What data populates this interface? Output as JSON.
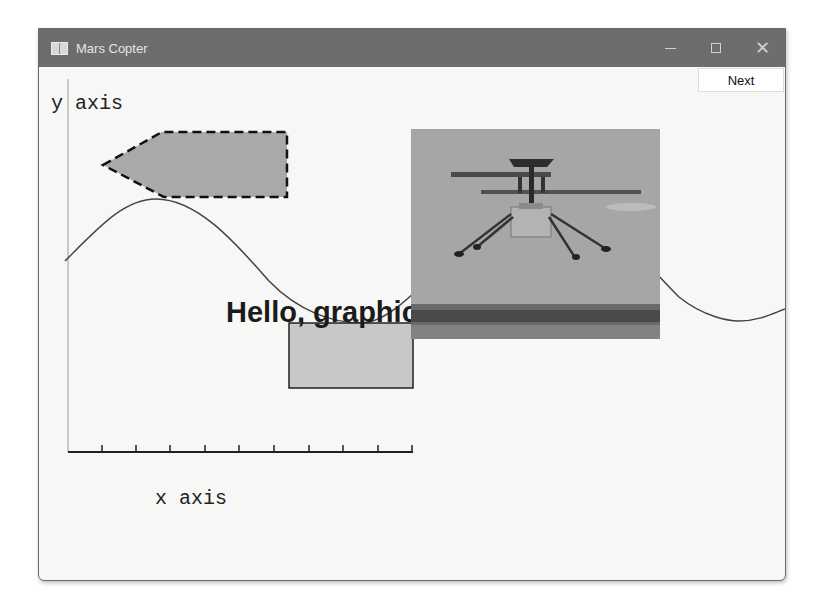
{
  "window": {
    "title": "Mars Copter",
    "controls": {
      "minimize": "minimize-icon",
      "maximize": "maximize-icon",
      "close": "close-icon"
    }
  },
  "toolbar": {
    "next_label": "Next"
  },
  "graph": {
    "y_axis_label": "y axis",
    "x_axis_label": "x axis",
    "text_label": "Hello, graphics",
    "x_tick_count": 10,
    "shapes": {
      "pentagon": {
        "fill": "#a9a9a9",
        "stroke": "#111111",
        "dashed": true
      },
      "rectangle": {
        "fill": "#c8c8c8",
        "stroke": "#222222"
      },
      "sine_curve": {
        "stroke": "#444444"
      }
    },
    "image": {
      "alt": "Mars helicopter in flight",
      "sky_color": "#a6a6a6",
      "ground_color": "#5b5b5b"
    }
  },
  "colors": {
    "titlebar": "#6d6d6d",
    "window_bg": "#f7f7f6"
  }
}
